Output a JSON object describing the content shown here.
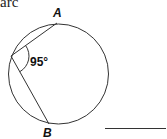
{
  "caption_fragment": "arc",
  "diagram": {
    "type": "inscribed-angle-circle",
    "points": {
      "A": "A",
      "B": "B"
    },
    "angle_label": "95°",
    "answer_blank": ""
  }
}
